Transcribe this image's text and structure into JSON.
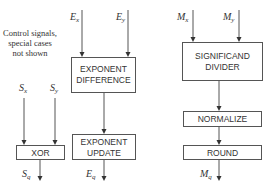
{
  "diagram": {
    "note": [
      "Control signals,",
      "special cases",
      "not shown"
    ],
    "blocks": {
      "exponent_difference": [
        "EXPONENT",
        "DIFFERENCE"
      ],
      "significand_divider": [
        "SIGNIFICAND",
        "DIVIDER"
      ],
      "xor": "XOR",
      "exponent_update": [
        "EXPONENT",
        "UPDATE"
      ],
      "normalize": "NORMALIZE",
      "round": "ROUND"
    },
    "inputs": {
      "sx": {
        "base": "S",
        "sub": "x"
      },
      "sy": {
        "base": "S",
        "sub": "y"
      },
      "ex": {
        "base": "E",
        "sub": "x"
      },
      "ey": {
        "base": "E",
        "sub": "y"
      },
      "mx": {
        "base": "M",
        "sub": "x"
      },
      "my": {
        "base": "M",
        "sub": "y"
      }
    },
    "outputs": {
      "sq": {
        "base": "S",
        "sub": "q"
      },
      "eq": {
        "base": "E",
        "sub": "q"
      },
      "mq": {
        "base": "M",
        "sub": "q"
      }
    }
  }
}
